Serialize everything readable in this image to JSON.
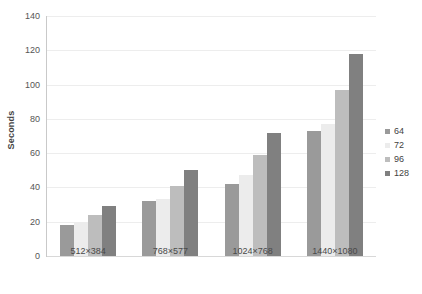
{
  "chart_data": {
    "type": "bar",
    "title": "",
    "xlabel": "",
    "ylabel": "Seconds",
    "categories": [
      "512×384",
      "768×577",
      "1024×768",
      "1440×1080"
    ],
    "series": [
      {
        "name": "64",
        "color": "#9a9a9a",
        "values": [
          18,
          32,
          42,
          73
        ]
      },
      {
        "name": "72",
        "color": "#ececec",
        "values": [
          20,
          33,
          47,
          77
        ]
      },
      {
        "name": "96",
        "color": "#bdbdbd",
        "values": [
          24,
          41,
          59,
          97
        ]
      },
      {
        "name": "128",
        "color": "#808080",
        "values": [
          29,
          50,
          72,
          118
        ]
      }
    ],
    "ylim": [
      0,
      140
    ],
    "yticks": [
      0,
      20,
      40,
      60,
      80,
      100,
      120,
      140
    ],
    "ytick_labels": [
      "0",
      "20",
      "40",
      "60",
      "80",
      "100",
      "120",
      "140"
    ],
    "grid": true,
    "legend_position": "right",
    "background_color": "#ffffff",
    "gridline_color": "#ededed",
    "axis_color": "#c9c9c9"
  }
}
